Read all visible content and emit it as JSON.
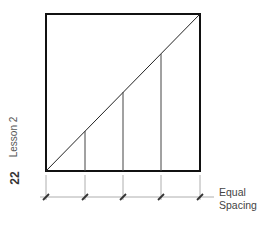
{
  "page": {
    "number": "22",
    "section": "Lesson 2"
  },
  "diagram": {
    "label_line1": "Equal",
    "label_line2": "Spacing",
    "colors": {
      "stroke": "#111111",
      "thin": "#555555",
      "text": "#444444"
    }
  }
}
